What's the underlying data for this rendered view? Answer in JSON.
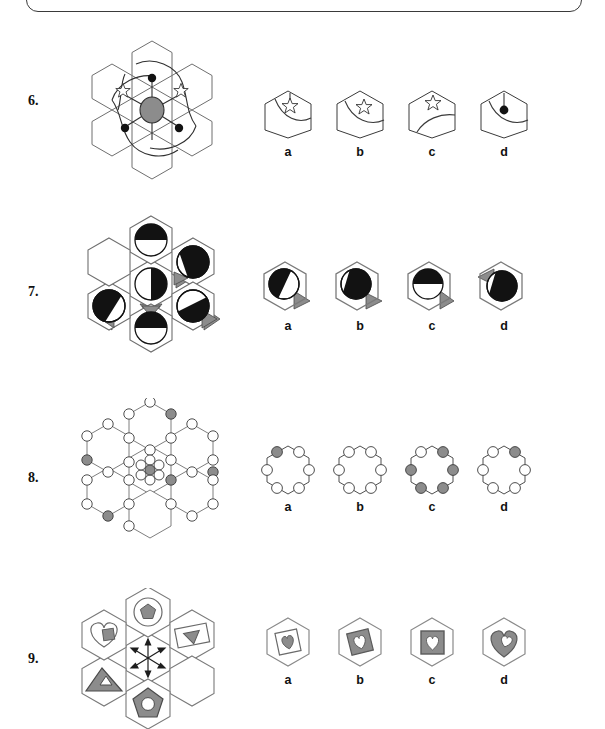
{
  "page": {
    "width": 605,
    "height": 729,
    "background": "#ffffff",
    "frame_border_color": "#3a3a3a",
    "type": "non-verbal-reasoning-worksheet"
  },
  "palette": {
    "line": "#3a3a3a",
    "line_light": "#6f6f6f",
    "black": "#121212",
    "gray_fill": "#8c8c8c",
    "gray_fill_dark": "#7a7a7a",
    "gray_fill_light": "#9a9a9a",
    "white": "#ffffff",
    "text": "#111111"
  },
  "option_letters": [
    "a",
    "b",
    "c",
    "d"
  ],
  "questions": [
    {
      "number": "6.",
      "id": "question-6",
      "stem": {
        "name": "hexagon-cluster-stem-6",
        "description": "Seven-hexagon flower cluster with a gray ellipse hub at centre. Six spokes radiate from the hub: three end in filled black dots, two end in outlined six-point stars, one spoke is plain. Three large S-curved arcs sweep across the cluster.",
        "hub_fill": "#8c8c8c",
        "spokes": 6,
        "dots": 3,
        "stars": 2,
        "arcs": 3
      },
      "options": [
        {
          "letter": "a",
          "name": "option-6-a",
          "contents": "hexagon with short stalk line from top edge to a six-point star, plus a concave arc sweeping to the right edge"
        },
        {
          "letter": "b",
          "name": "option-6-b",
          "contents": "hexagon with a six-point star and an arc curving from upper-left edge down to the right edge"
        },
        {
          "letter": "c",
          "name": "option-6-c",
          "contents": "hexagon with a six-point star near the top vertex and a quarter arc from lower-left to right edge"
        },
        {
          "letter": "d",
          "name": "option-6-d",
          "contents": "hexagon with a stalk line from top edge to a filled black dot and an arc to the right edge"
        }
      ]
    },
    {
      "number": "7.",
      "id": "question-7",
      "stem": {
        "name": "hexagon-cluster-stem-7",
        "description": "Seven-hexagon flower cluster. Six of the hexagons hold a circle split into black and white halves at varying rotations; small gray triangles sit on the hexagon edges pointing in different directions. The upper-left hexagon is empty.",
        "circles": 6,
        "empty_cells": 1,
        "gray_triangles": 5
      },
      "options": [
        {
          "letter": "a",
          "name": "option-7-a",
          "contents": "hexagon with circle whose left portion is black, gray triangle on lower-right edge"
        },
        {
          "letter": "b",
          "name": "option-7-b",
          "contents": "hexagon with circle whose right/lower portion is black, gray triangle on lower-right edge"
        },
        {
          "letter": "c",
          "name": "option-7-c",
          "contents": "hexagon with circle whose top half is black, gray triangle on lower-right edge"
        },
        {
          "letter": "d",
          "name": "option-7-d",
          "contents": "hexagon with circle whose lower-right portion is black, gray triangle on upper-left edge"
        }
      ]
    },
    {
      "number": "8.",
      "id": "question-8",
      "stem": {
        "name": "hexagon-cluster-stem-8",
        "description": "Seven-hexagon flower cluster drawn in thin outline with a small circle at every hexagon vertex. Most vertex circles are white; five are filled gray. The centre hexagon holds a tight rosette of seven small circles with a gray circle in the middle.",
        "vertex_circles_total": 30,
        "gray_vertex_circles": 5,
        "centre_rosette_circles": 7
      },
      "options": [
        {
          "letter": "a",
          "name": "option-8-a",
          "contents": "hexagon with six vertex circles; the upper-left circle is gray, the rest white"
        },
        {
          "letter": "b",
          "name": "option-8-b",
          "contents": "hexagon with six vertex circles, all white"
        },
        {
          "letter": "c",
          "name": "option-8-c",
          "contents": "hexagon with six vertex circles; four gray (upper-right, left, right, lower-left, lower-right) and white at upper-left"
        },
        {
          "letter": "d",
          "name": "option-8-d",
          "contents": "hexagon with six vertex circles; the upper-right circle is gray, the rest white"
        }
      ]
    },
    {
      "number": "9.",
      "id": "question-9",
      "stem": {
        "name": "hexagon-cluster-stem-9",
        "description": "Seven-hexagon flower cluster. Five hexagons contain nested shape pairs: heart with gray square, circle with gray pentagon, tilted rectangle with gray triangle, gray triangle with white triangle, gray pentagon with white circle. The centre hexagon holds a six-headed arrow star; one hexagon is empty.",
        "filled_cells": 5,
        "empty_cells": 1,
        "centre": "six-headed arrow star"
      },
      "options": [
        {
          "letter": "a",
          "name": "option-9-a",
          "contents": "hexagon containing a white tilted square holding a gray heart"
        },
        {
          "letter": "b",
          "name": "option-9-b",
          "contents": "hexagon containing a gray tilted square holding a white heart"
        },
        {
          "letter": "c",
          "name": "option-9-c",
          "contents": "hexagon containing an upright gray square holding a white heart"
        },
        {
          "letter": "d",
          "name": "option-9-d",
          "contents": "hexagon containing a gray heart holding a white heart"
        }
      ]
    }
  ]
}
